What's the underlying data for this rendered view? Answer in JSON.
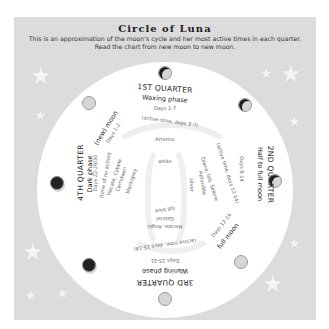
{
  "header": {
    "title": "Circle of Luna",
    "subtitle_line1": "This is an approximation of the moon's cycle and her most active times in each quarter.",
    "subtitle_line2": "Read the chart from new moon to new moon."
  },
  "quarters": {
    "first": {
      "title": "1ST QUARTER",
      "phase": "Waxing phase",
      "days": "Days 1-7",
      "active": "(active time, days 3-7)",
      "goddesses": [
        "Artemis"
      ],
      "color": "white"
    },
    "second": {
      "title": "2ND QUARTER",
      "phase": "Half to full moon",
      "days": "Days 8-14",
      "active": "(active time, days 12-14)",
      "goddesses": [
        "Diana, Isis, Selene",
        "Aphrodite"
      ],
      "color": "silver"
    },
    "full": {
      "label": "full moon",
      "days": "Days 12-14"
    },
    "third": {
      "title": "3RD QUARTER",
      "phase": "Waning phase",
      "days": "Days 15-21",
      "active": "(active time, days 15-18)",
      "goddesses": [
        "Hecate, Anglo",
        "Gabriel"
      ],
      "color": "fall blue"
    },
    "fourth": {
      "title": "4TH QUARTER",
      "phase": "Dark phase",
      "days": "Days 22-29/30",
      "active": "(time of no action)",
      "goddesses": [
        "Hecate, Cybele",
        "Cerridwen"
      ],
      "color": "black/grey"
    },
    "new": {
      "label": "(new) moon",
      "days": "Days 1-2"
    }
  },
  "moons": [
    {
      "position": "top",
      "type": "crescent"
    },
    {
      "position": "top-right",
      "type": "crescent"
    },
    {
      "position": "right",
      "type": "crescent"
    },
    {
      "position": "bottom-right",
      "type": "full"
    },
    {
      "position": "bottom",
      "type": "full"
    },
    {
      "position": "bottom-left",
      "type": "dark"
    },
    {
      "position": "left",
      "type": "dark"
    },
    {
      "position": "top-left",
      "type": "full"
    }
  ],
  "colors": {
    "background_panel": "#dcdcdc",
    "disc": "#ffffff",
    "text": "#222222",
    "dark_moon": "#222222",
    "light_moon": "#d6d6d6"
  }
}
